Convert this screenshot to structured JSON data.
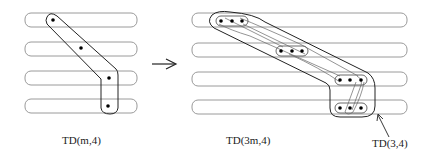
{
  "diagram": {
    "arrow": "→",
    "left": {
      "label": "TD(m,4)",
      "rows": 4,
      "dots_per_row": 1
    },
    "right": {
      "label": "TD(3m,4)",
      "rows": 4,
      "dots_per_row": 3,
      "callout_label": "TD(3,4)"
    }
  },
  "colors": {
    "bar_stroke": "#9a9a9a",
    "tube_stroke": "#222222",
    "inner_tube_stroke": "#555555",
    "dot": "#000000",
    "text": "#222222"
  }
}
